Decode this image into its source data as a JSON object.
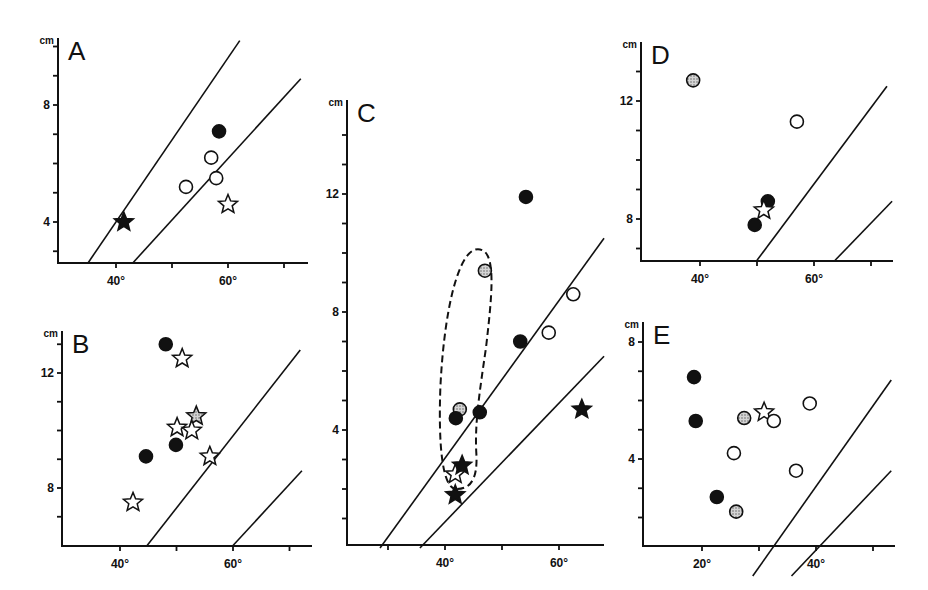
{
  "figure": {
    "panel_letters": [
      "A",
      "B",
      "C",
      "D",
      "E"
    ],
    "y_unit": "cm",
    "degree_symbol": "°"
  },
  "colors": {
    "ink": "#111111",
    "stipple": "#9a9a9a",
    "background": "#ffffff"
  },
  "chart_data": [
    {
      "panel": "A",
      "type": "scatter",
      "title": "A",
      "xlabel": "",
      "ylabel": "cm",
      "x_ticks": [
        40,
        50,
        60,
        70
      ],
      "x_tick_labels": [
        "40°",
        "",
        "60°",
        ""
      ],
      "y_ticks": [
        3,
        4,
        5,
        6,
        7,
        8,
        9,
        10
      ],
      "y_tick_labels": [
        "",
        "4",
        "",
        "",
        "",
        "8",
        "",
        ""
      ],
      "xlim": [
        30,
        74.5
      ],
      "ylim": [
        2.65,
        11.6
      ],
      "frame": {
        "x0": 58,
        "y0": 263,
        "x1": 308,
        "y1": 38,
        "px_x_ref": [
          116,
          40
        ],
        "px_per_unit_x": 5.6,
        "px_y_ref": [
          105,
          8
        ],
        "px_per_unit_y": 29.25
      },
      "reference_lines": [
        {
          "from": [
            35.0,
            2.6
          ],
          "to": [
            62.1,
            10.2
          ]
        },
        {
          "from": [
            43.0,
            2.6
          ],
          "to": [
            73.0,
            8.9
          ]
        }
      ],
      "points": [
        {
          "marker": "filled-circle",
          "x": 58.4,
          "y": 7.1
        },
        {
          "marker": "open-circle",
          "x": 57.0,
          "y": 6.2
        },
        {
          "marker": "open-circle",
          "x": 57.9,
          "y": 5.5
        },
        {
          "marker": "open-circle",
          "x": 52.5,
          "y": 5.2
        },
        {
          "marker": "open-star",
          "x": 60.0,
          "y": 4.6
        },
        {
          "marker": "filled-star",
          "x": 41.4,
          "y": 4.0
        }
      ]
    },
    {
      "panel": "B",
      "type": "scatter",
      "title": "B",
      "xlabel": "",
      "ylabel": "cm",
      "x_ticks": [
        40,
        50,
        60,
        70
      ],
      "x_tick_labels": [
        "40°",
        "",
        "60°",
        ""
      ],
      "y_ticks": [
        7,
        8,
        9,
        10,
        11,
        12,
        13
      ],
      "y_tick_labels": [
        "",
        "8",
        "",
        "",
        "",
        "12",
        ""
      ],
      "xlim": [
        29.7,
        74
      ],
      "ylim": [
        5.95,
        14.0
      ],
      "frame": {
        "x0": 62,
        "y0": 546,
        "x1": 312,
        "y1": 331,
        "px_x_ref": [
          120,
          40
        ],
        "px_per_unit_x": 5.65,
        "px_y_ref": [
          373,
          12
        ],
        "px_per_unit_y": 28.75
      },
      "reference_lines": [
        {
          "from": [
            44.8,
            6.0
          ],
          "to": [
            71.9,
            12.8
          ]
        },
        {
          "from": [
            60.0,
            6.0
          ],
          "to": [
            72.2,
            8.6
          ]
        }
      ],
      "points": [
        {
          "marker": "filled-circle",
          "x": 48.1,
          "y": 13.0
        },
        {
          "marker": "open-star",
          "x": 51.0,
          "y": 12.5
        },
        {
          "marker": "stippled-star",
          "x": 53.5,
          "y": 10.5
        },
        {
          "marker": "open-star",
          "x": 50.1,
          "y": 10.1
        },
        {
          "marker": "open-star",
          "x": 52.7,
          "y": 10.0
        },
        {
          "marker": "filled-circle",
          "x": 49.9,
          "y": 9.5
        },
        {
          "marker": "filled-circle",
          "x": 44.6,
          "y": 9.1
        },
        {
          "marker": "open-star",
          "x": 55.9,
          "y": 9.1
        },
        {
          "marker": "open-star",
          "x": 42.3,
          "y": 7.5
        }
      ]
    },
    {
      "panel": "C",
      "type": "scatter",
      "title": "C",
      "xlabel": "",
      "ylabel": "cm",
      "x_ticks": [
        30,
        40,
        50,
        60
      ],
      "x_tick_labels": [
        "",
        "40°",
        "",
        "60°"
      ],
      "y_ticks": [
        1,
        2,
        3,
        4,
        5,
        6,
        7,
        8,
        9,
        10,
        11,
        12,
        13,
        14
      ],
      "y_tick_labels": [
        "",
        "",
        "",
        "4",
        "",
        "",
        "",
        "8",
        "",
        "",
        "",
        "12",
        "",
        ""
      ],
      "xlim": [
        23,
        68
      ],
      "ylim": [
        0,
        15
      ],
      "frame": {
        "x0": 347,
        "y0": 545,
        "x1": 604,
        "y1": 100,
        "px_x_ref": [
          445,
          40
        ],
        "px_per_unit_x": 5.7,
        "px_y_ref": [
          430,
          4
        ],
        "px_per_unit_y": 29.5
      },
      "reference_lines": [
        {
          "from": [
            28.6,
            0.0
          ],
          "to": [
            67.9,
            10.5
          ]
        },
        {
          "from": [
            35.6,
            0.0
          ],
          "to": [
            67.9,
            6.5
          ]
        }
      ],
      "enclosure": {
        "style": "dashed",
        "encloses": [
          "stippled-circle@47.0,9.4",
          "stippled-circle@42.6,4.7",
          "open-star@41.8,2.5",
          "filled-star@43.0,2.8"
        ]
      },
      "points": [
        {
          "marker": "filled-circle",
          "x": 54.2,
          "y": 11.9
        },
        {
          "marker": "stippled-circle",
          "x": 47.0,
          "y": 9.4
        },
        {
          "marker": "open-circle",
          "x": 62.5,
          "y": 8.6
        },
        {
          "marker": "open-circle",
          "x": 58.2,
          "y": 7.3
        },
        {
          "marker": "filled-circle",
          "x": 53.2,
          "y": 7.0
        },
        {
          "marker": "stippled-circle",
          "x": 42.6,
          "y": 4.7
        },
        {
          "marker": "filled-circle",
          "x": 41.9,
          "y": 4.4
        },
        {
          "marker": "filled-circle",
          "x": 46.1,
          "y": 4.6
        },
        {
          "marker": "filled-star",
          "x": 64.0,
          "y": 4.7
        },
        {
          "marker": "open-star",
          "x": 41.8,
          "y": 2.5
        },
        {
          "marker": "filled-star",
          "x": 43.0,
          "y": 2.8
        },
        {
          "marker": "filled-star",
          "x": 41.8,
          "y": 1.8
        }
      ]
    },
    {
      "panel": "D",
      "type": "scatter",
      "title": "D",
      "xlabel": "",
      "ylabel": "cm",
      "x_ticks": [
        40,
        50,
        60,
        70
      ],
      "x_tick_labels": [
        "40°",
        "",
        "60°",
        ""
      ],
      "y_ticks": [
        7,
        8,
        9,
        10,
        11,
        12,
        13
      ],
      "y_tick_labels": [
        "",
        "8",
        "",
        "",
        "",
        "12",
        ""
      ],
      "xlim": [
        29.6,
        74
      ],
      "ylim": [
        6.6,
        14.2
      ],
      "frame": {
        "x0": 641,
        "y0": 261,
        "x1": 893,
        "y1": 42,
        "px_x_ref": [
          700,
          40
        ],
        "px_per_unit_x": 5.7,
        "px_y_ref": [
          101,
          12
        ],
        "px_per_unit_y": 29.5
      },
      "reference_lines": [
        {
          "from": [
            50.0,
            6.6
          ],
          "to": [
            72.8,
            12.5
          ]
        },
        {
          "from": [
            63.7,
            6.6
          ],
          "to": [
            73.7,
            8.6
          ]
        }
      ],
      "points": [
        {
          "marker": "stippled-circle",
          "x": 38.8,
          "y": 12.7
        },
        {
          "marker": "open-circle",
          "x": 57.0,
          "y": 11.3
        },
        {
          "marker": "filled-circle",
          "x": 51.9,
          "y": 8.6
        },
        {
          "marker": "open-star",
          "x": 51.2,
          "y": 8.3
        },
        {
          "marker": "filled-circle",
          "x": 49.6,
          "y": 7.8
        }
      ]
    },
    {
      "panel": "E",
      "type": "scatter",
      "title": "E",
      "xlabel": "",
      "ylabel": "cm",
      "x_ticks": [
        20,
        30,
        40,
        50
      ],
      "x_tick_labels": [
        "20°",
        "",
        "40°",
        ""
      ],
      "y_ticks": [
        1,
        2,
        3,
        4,
        5,
        6,
        7,
        8
      ],
      "y_tick_labels": [
        "",
        "",
        "",
        "4",
        "",
        "",
        "",
        "8"
      ],
      "xlim": [
        9.6,
        54
      ],
      "ylim": [
        0,
        8.8
      ],
      "frame": {
        "x0": 643,
        "y0": 546,
        "x1": 895,
        "y1": 322,
        "px_x_ref": [
          702,
          20
        ],
        "px_per_unit_x": 5.7,
        "px_y_ref": [
          459,
          4
        ],
        "px_per_unit_y": 29.25
      },
      "reference_lines": [
        {
          "from": [
            28.9,
            0.0
          ],
          "to": [
            53.2,
            6.7
          ]
        },
        {
          "from": [
            35.7,
            0.0
          ],
          "to": [
            53.2,
            3.6
          ]
        }
      ],
      "points": [
        {
          "marker": "filled-circle",
          "x": 18.6,
          "y": 6.8
        },
        {
          "marker": "filled-circle",
          "x": 18.9,
          "y": 5.3
        },
        {
          "marker": "stippled-circle",
          "x": 27.4,
          "y": 5.4
        },
        {
          "marker": "open-star",
          "x": 30.9,
          "y": 5.6
        },
        {
          "marker": "open-circle",
          "x": 32.6,
          "y": 5.3
        },
        {
          "marker": "open-circle",
          "x": 38.9,
          "y": 5.9
        },
        {
          "marker": "open-circle",
          "x": 25.6,
          "y": 4.2
        },
        {
          "marker": "open-circle",
          "x": 36.5,
          "y": 3.6
        },
        {
          "marker": "filled-circle",
          "x": 22.6,
          "y": 2.7
        },
        {
          "marker": "stippled-circle",
          "x": 26.0,
          "y": 2.2
        }
      ]
    }
  ]
}
